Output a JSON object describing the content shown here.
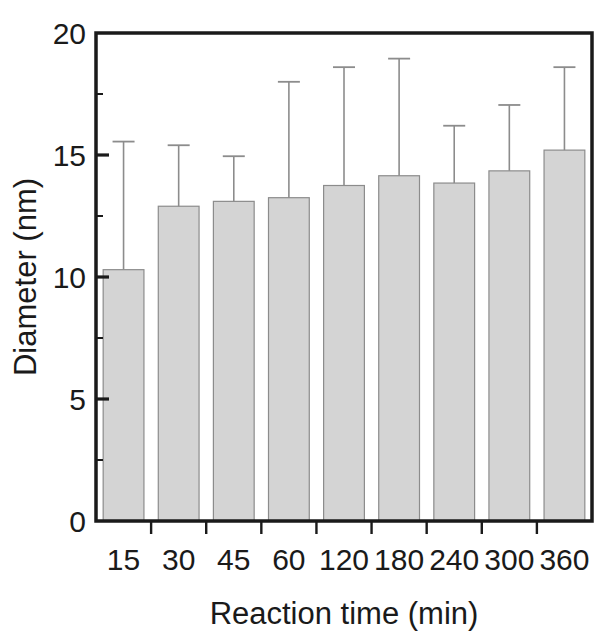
{
  "chart_data": {
    "type": "bar",
    "title": "",
    "xlabel": "Reaction time (min)",
    "ylabel": "Diameter (nm)",
    "categories": [
      "15",
      "30",
      "45",
      "60",
      "120",
      "180",
      "240",
      "300",
      "360"
    ],
    "values": [
      10.3,
      12.9,
      13.1,
      13.25,
      13.75,
      14.15,
      13.85,
      14.35,
      15.2
    ],
    "error_upper": [
      15.55,
      15.4,
      14.95,
      18.0,
      18.6,
      18.95,
      16.2,
      17.05,
      18.6
    ],
    "errors": [
      5.25,
      2.5,
      1.85,
      4.75,
      4.85,
      4.8,
      2.35,
      2.7,
      3.4
    ],
    "error_direction": "upper-only",
    "ylim": [
      0,
      20
    ],
    "yticks": [
      0,
      5,
      10,
      15,
      20
    ],
    "ytick_labels": [
      "0",
      "5",
      "10",
      "15",
      "20"
    ],
    "xtick_labels": [
      "15",
      "30",
      "45",
      "60",
      "120",
      "180",
      "240",
      "300",
      "360"
    ],
    "grid": false,
    "legend": null,
    "bar_color": "#d4d4d4",
    "bar_edge_color": "#8c8c8c",
    "axis_color": "#1a1a1a",
    "error_bar_color": "#8c8c8c",
    "background_color": "#ffffff"
  }
}
